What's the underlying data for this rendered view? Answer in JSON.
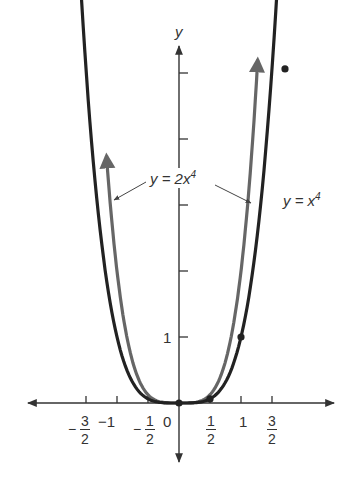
{
  "chart_data": {
    "type": "line",
    "title": "",
    "xlabel": "",
    "ylabel": "y",
    "series": [
      {
        "name": "y = x^4",
        "label_text": "y = x",
        "exp": "4",
        "color": "#222222",
        "x": [
          -1.6,
          -1.5,
          -1,
          -0.5,
          0,
          0.5,
          1,
          1.5,
          1.55
        ],
        "y": [
          6.55,
          5.06,
          1,
          0.0625,
          0,
          0.0625,
          1,
          5.06,
          5.77
        ],
        "marked_points": [
          [
            0,
            0
          ],
          [
            0.5,
            0.0625
          ],
          [
            1,
            1
          ],
          [
            1.5,
            5.0625
          ]
        ]
      },
      {
        "name": "y = 2x^4",
        "label_text": "y = 2x",
        "exp": "4",
        "color": "#666666",
        "x": [
          -1.19,
          -1,
          -0.5,
          0,
          0.5,
          1,
          1.19
        ],
        "y": [
          4.0,
          2,
          0.125,
          0,
          0.125,
          2,
          4.0
        ]
      }
    ],
    "x_ticks": [
      {
        "value": -1.5,
        "label": "-3/2"
      },
      {
        "value": -1,
        "label": "-1"
      },
      {
        "value": -0.5,
        "label": "-1/2"
      },
      {
        "value": 0,
        "label": "0"
      },
      {
        "value": 0.5,
        "label": "1/2"
      },
      {
        "value": 1,
        "label": "1"
      },
      {
        "value": 1.5,
        "label": "3/2"
      }
    ],
    "y_ticks": [
      {
        "value": 1,
        "label": "1"
      },
      {
        "value": 2,
        "label": ""
      },
      {
        "value": 3,
        "label": ""
      },
      {
        "value": 4,
        "label": ""
      },
      {
        "value": 5,
        "label": ""
      }
    ],
    "grid": false
  },
  "labels": {
    "y_axis": "y",
    "origin": "0",
    "one_x": "1",
    "minus_one": "−1",
    "one_y": "1",
    "three": "3",
    "two": "2",
    "one": "1",
    "minus": "−",
    "curve2": "y = 2x",
    "curve1": "y = x",
    "exp": "4"
  }
}
